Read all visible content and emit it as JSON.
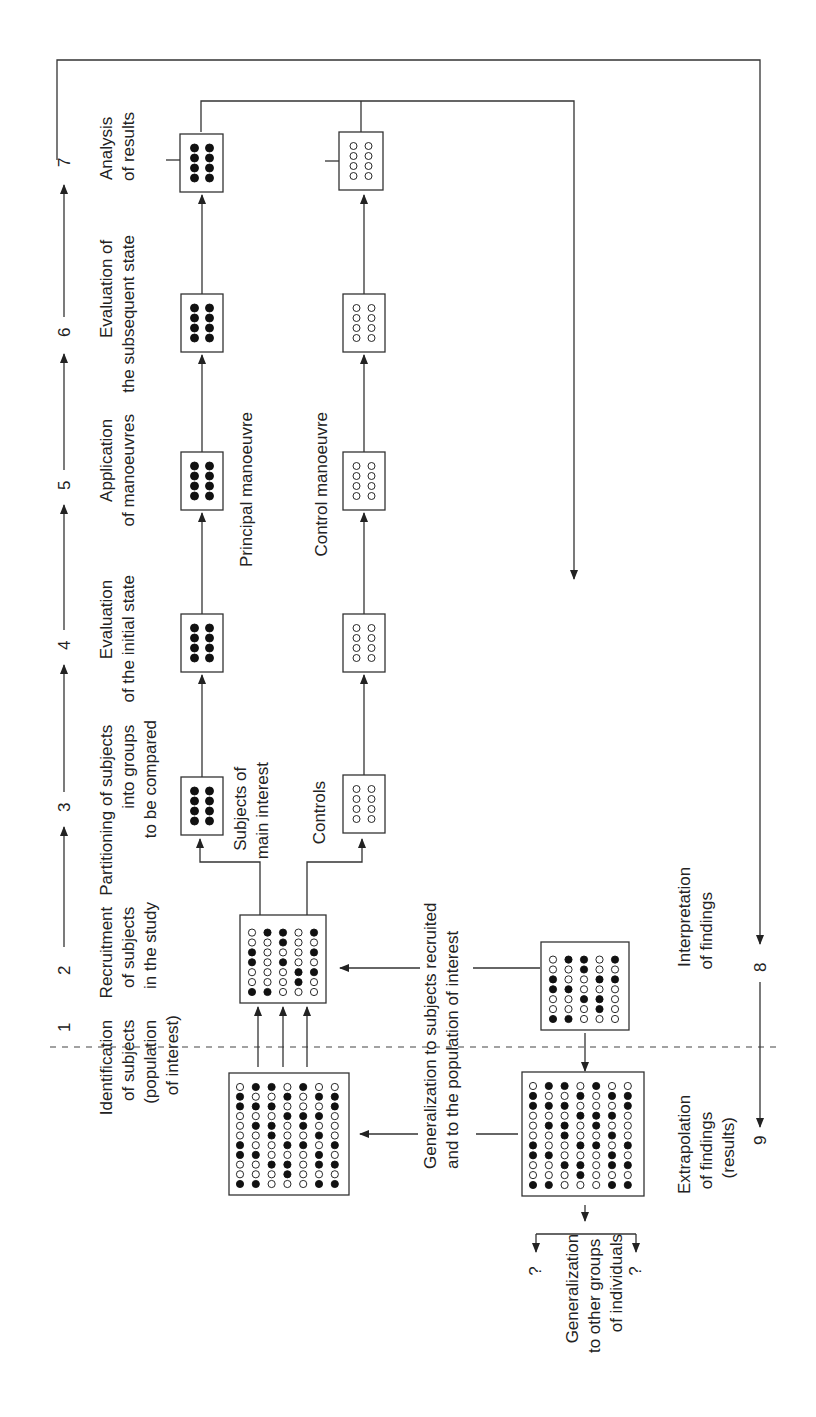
{
  "diagram": {
    "orientation": "rotated-90-ccw",
    "steps": [
      {
        "num": "1",
        "lines": [
          "Identification",
          "of subjects",
          "(population",
          "of interest)"
        ]
      },
      {
        "num": "2",
        "lines": [
          "Recruitment",
          "of subjects",
          "in the study"
        ]
      },
      {
        "num": "3",
        "lines": [
          "Partitioning of subjects",
          "into groups",
          "to be compared"
        ]
      },
      {
        "num": "4",
        "lines": [
          "Evaluation",
          "of the initial state"
        ]
      },
      {
        "num": "5",
        "lines": [
          "Application",
          "of manoeuvres"
        ]
      },
      {
        "num": "6",
        "lines": [
          "Evaluation of",
          "the subsequent state"
        ]
      },
      {
        "num": "7",
        "lines": [
          "Analysis",
          "of results"
        ]
      },
      {
        "num": "8",
        "lines": [
          "Interpretation",
          "of findings"
        ]
      },
      {
        "num": "9",
        "lines": [
          "Extrapolation",
          "of findings",
          "(results)"
        ]
      }
    ],
    "group_labels": {
      "subjects": [
        "Subjects of",
        "main interest"
      ],
      "controls": [
        "Controls"
      ],
      "principal_manoeuvre": "Principal manoeuvre",
      "control_manoeuvre": "Control manoeuvre"
    },
    "generalization_recruited": [
      "Generalization to subjects recruited",
      "and to the population of interest"
    ],
    "generalization_other": [
      "Generalization",
      "to other groups",
      "of individuals"
    ],
    "unknown_marker": "?",
    "grids": {
      "population": [
        "0110100",
        "1001011",
        "1110001",
        "0001110",
        "0110100",
        "0010010",
        "1001101",
        "1100010",
        "0011011",
        "0001000",
        "1100011"
      ],
      "recruited": [
        "01101",
        "00100",
        "10001",
        "10100",
        "00011",
        "00010",
        "11000"
      ],
      "interpretation": [
        "01101",
        "00100",
        "10011",
        "11000",
        "00110",
        "00010",
        "11000"
      ]
    },
    "colors": {
      "ink": "#222222",
      "background": "#ffffff"
    }
  }
}
